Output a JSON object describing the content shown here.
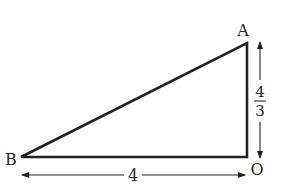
{
  "diagram": {
    "type": "right-triangle",
    "vertices": {
      "A": {
        "label": "A",
        "x": 247,
        "y": 43
      },
      "B": {
        "label": "B",
        "x": 21,
        "y": 157
      },
      "O": {
        "label": "O",
        "x": 247,
        "y": 157
      }
    },
    "dimensions": {
      "base": {
        "label": "4",
        "from": "B",
        "to": "O"
      },
      "height": {
        "numerator": "4",
        "denominator": "3",
        "from": "A",
        "to": "O"
      }
    },
    "colors": {
      "stroke": "#222222",
      "text": "#2a2a2a",
      "background": "#ffffff"
    }
  }
}
